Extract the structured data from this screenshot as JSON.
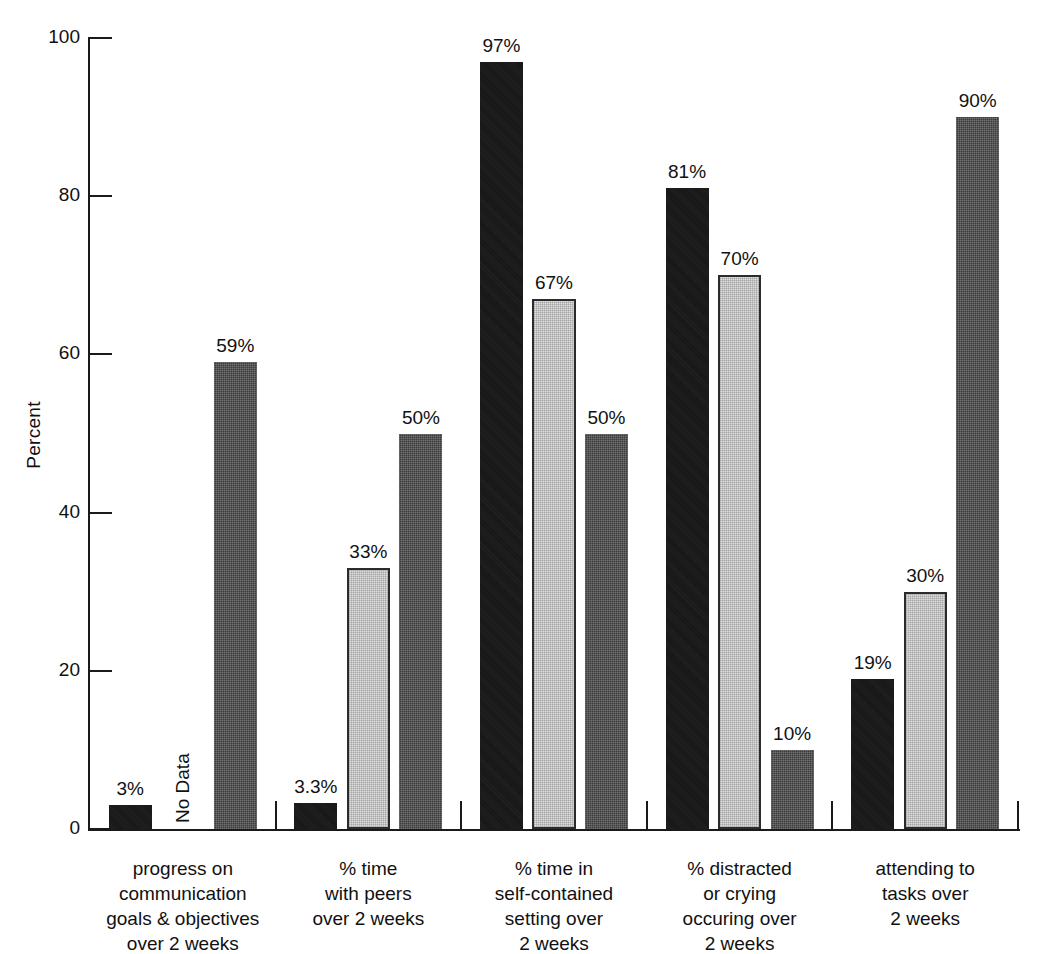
{
  "chart_data": {
    "type": "bar",
    "title": "",
    "xlabel": "",
    "ylabel": "Percent",
    "ylim": [
      0,
      100
    ],
    "yticks": [
      0,
      20,
      40,
      60,
      80,
      100
    ],
    "ytick_labels": [
      "0",
      "20",
      "40",
      "60",
      "80",
      "100"
    ],
    "grid": false,
    "legend": "none",
    "categories": [
      "progress on\ncommunication\ngoals & objectives\nover 2 weeks",
      "% time\nwith peers\nover 2 weeks",
      "% time in\nself-contained\nsetting over\n2 weeks",
      "% distracted\nor crying\noccuring over\n2 weeks",
      "attending to\ntasks over\n2 weeks"
    ],
    "series": [
      {
        "name": "series-1",
        "style": "black",
        "values": [
          3,
          3.3,
          97,
          81,
          19
        ],
        "labels": [
          "3%",
          "3.3%",
          "97%",
          "81%",
          "19%"
        ]
      },
      {
        "name": "series-2",
        "style": "lightgray",
        "values": [
          null,
          33,
          67,
          70,
          30
        ],
        "labels": [
          "No Data",
          "33%",
          "67%",
          "70%",
          "30%"
        ]
      },
      {
        "name": "series-3",
        "style": "darkgray",
        "values": [
          59,
          50,
          50,
          10,
          90
        ],
        "labels": [
          "59%",
          "50%",
          "50%",
          "10%",
          "90%"
        ]
      }
    ],
    "no_data_text": "No Data",
    "colors": {
      "series_1": "#161616",
      "series_2": "#dedede",
      "series_3": "#3b3b3b",
      "axis": "#1a1a1a",
      "text": "#111111",
      "background": "#ffffff"
    }
  },
  "axis": {
    "y_label": "Percent",
    "ticks": [
      {
        "value": 100,
        "label": "100"
      },
      {
        "value": 80,
        "label": "80"
      },
      {
        "value": 60,
        "label": "60"
      },
      {
        "value": 40,
        "label": "40"
      },
      {
        "value": 20,
        "label": "20"
      },
      {
        "value": 0,
        "label": "0"
      }
    ]
  },
  "groups": [
    {
      "label_lines": [
        "progress on",
        "communication",
        "goals & objectives",
        "over 2 weeks"
      ],
      "bars": [
        {
          "style": "black",
          "value": 3,
          "label": "3%"
        },
        {
          "style": "none",
          "value": null,
          "label": "No Data"
        },
        {
          "style": "darkgray",
          "value": 59,
          "label": "59%"
        }
      ]
    },
    {
      "label_lines": [
        "% time",
        "with peers",
        "over 2 weeks"
      ],
      "bars": [
        {
          "style": "black",
          "value": 3.3,
          "label": "3.3%"
        },
        {
          "style": "lightgray",
          "value": 33,
          "label": "33%"
        },
        {
          "style": "darkgray",
          "value": 50,
          "label": "50%"
        }
      ]
    },
    {
      "label_lines": [
        "% time in",
        "self-contained",
        "setting over",
        "2 weeks"
      ],
      "bars": [
        {
          "style": "black",
          "value": 97,
          "label": "97%"
        },
        {
          "style": "lightgray",
          "value": 67,
          "label": "67%"
        },
        {
          "style": "darkgray",
          "value": 50,
          "label": "50%"
        }
      ]
    },
    {
      "label_lines": [
        "% distracted",
        "or crying",
        "occuring over",
        "2 weeks"
      ],
      "bars": [
        {
          "style": "black",
          "value": 81,
          "label": "81%"
        },
        {
          "style": "lightgray",
          "value": 70,
          "label": "70%"
        },
        {
          "style": "darkgray",
          "value": 10,
          "label": "10%"
        }
      ]
    },
    {
      "label_lines": [
        "attending to",
        "tasks over",
        "2 weeks"
      ],
      "bars": [
        {
          "style": "black",
          "value": 19,
          "label": "19%"
        },
        {
          "style": "lightgray",
          "value": 30,
          "label": "30%"
        },
        {
          "style": "darkgray",
          "value": 90,
          "label": "90%"
        }
      ]
    }
  ]
}
